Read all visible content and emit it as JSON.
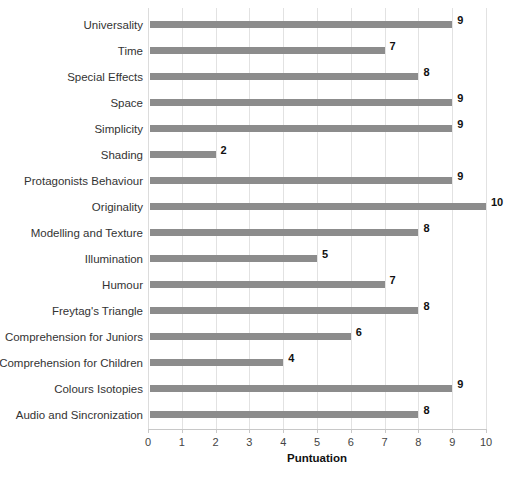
{
  "chart_data": {
    "type": "bar",
    "orientation": "horizontal",
    "title": "",
    "xlabel": "Puntuation",
    "ylabel": "",
    "xlim": [
      0,
      10
    ],
    "xticks": [
      "0",
      "1",
      "2",
      "3",
      "4",
      "5",
      "6",
      "7",
      "8",
      "9",
      "10"
    ],
    "grid": true,
    "legend": false,
    "bar_color": "#8c8c8c",
    "categories": [
      "Universality",
      "Time",
      "Special Effects",
      "Space",
      "Simplicity",
      "Shading",
      "Protagonists Behaviour",
      "Originality",
      "Modelling and Texture",
      "Illumination",
      "Humour",
      "Freytag's Triangle",
      "Comprehension for Juniors",
      "Comprehension for Children",
      "Colours Isotopies",
      "Audio and Sincronization"
    ],
    "values": [
      9,
      7,
      8,
      9,
      9,
      2,
      9,
      10,
      8,
      5,
      7,
      8,
      6,
      4,
      9,
      8
    ],
    "value_labels": [
      "9",
      "7",
      "8",
      "9",
      "9",
      "2",
      "9",
      "10",
      "8",
      "5",
      "7",
      "8",
      "6",
      "4",
      "9",
      "8"
    ]
  }
}
